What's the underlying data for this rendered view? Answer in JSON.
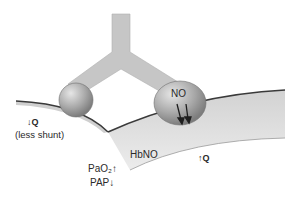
{
  "diagram": {
    "left_vessel": {
      "flow_label": "↓Q",
      "flow_note": "(less shunt)"
    },
    "right_vessel": {
      "flow_label": "↑Q",
      "segment_label": "HbNO"
    },
    "molecule_right_label": "NO",
    "effects": {
      "pao2": "PaO₂↑",
      "pap": "PAP↓"
    },
    "colors": {
      "sphere": "#a8a8a8",
      "linker": "#c4c4c4",
      "vessel_fill": "#dcdcdc",
      "vessel_line": "#3a3a3a",
      "text": "#2a2a2a"
    }
  }
}
